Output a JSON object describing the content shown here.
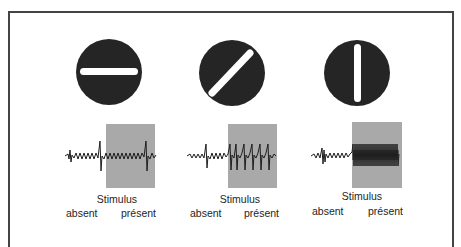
{
  "figure": {
    "background": "#ffffff",
    "border_color": "#444444",
    "disc_color": "#252525",
    "bar_color": "#ffffff",
    "stimulus_box_color": "#a9a9a9",
    "trace_color": "#1e1e1e"
  },
  "panels": [
    {
      "orientation": "horizontal",
      "bar_angle_deg": 0,
      "response": "weak",
      "stimulus_label": "Stimulus",
      "absent_label": "absent",
      "present_label": "présent"
    },
    {
      "orientation": "oblique",
      "bar_angle_deg": 45,
      "response": "moderate",
      "stimulus_label": "Stimulus",
      "absent_label": "absent",
      "present_label": "présent"
    },
    {
      "orientation": "vertical",
      "bar_angle_deg": 90,
      "response": "strong",
      "stimulus_label": "Stimulus",
      "absent_label": "absent",
      "present_label": "présent"
    }
  ]
}
